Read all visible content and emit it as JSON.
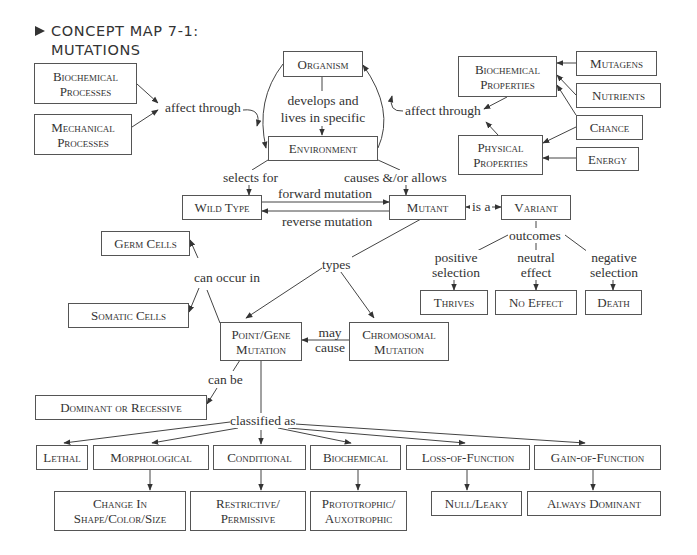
{
  "title": {
    "line1": "CONCEPT MAP 7-1:",
    "line2": "MUTATIONS",
    "marker_icon": "triangle-right-icon"
  },
  "nodes": {
    "biochemical_processes": "Biochemical Processes",
    "mechanical_processes": "Mechanical Processes",
    "organism": "Organism",
    "environment": "Environment",
    "biochemical_properties": "Biochemical Properties",
    "physical_properties": "Physical Properties",
    "mutagens": "Mutagens",
    "nutrients": "Nutrients",
    "chance": "Chance",
    "energy": "Energy",
    "wild_type": "Wild Type",
    "mutant": "Mutant",
    "variant": "Variant",
    "germ_cells": "Germ Cells",
    "somatic_cells": "Somatic Cells",
    "point_gene_mutation": "Point/Gene Mutation",
    "chromosomal_mutation": "Chromosomal Mutation",
    "thrives": "Thrives",
    "no_effect": "No Effect",
    "death": "Death",
    "dominant_or_recessive": "Dominant or Recessive",
    "lethal": "Lethal",
    "morphological": "Morphological",
    "conditional": "Conditional",
    "biochemical": "Biochemical",
    "loss_of_function": "Loss-of-Function",
    "gain_of_function": "Gain-of-Function",
    "change_in_shape": "Change In Shape/Color/Size",
    "restrictive_permissive": "Restrictive/ Permissive",
    "prototrophic_auxotrophic": "Prototrophic/ Auxotrophic",
    "null_leaky": "Null/Leaky",
    "always_dominant": "Always Dominant"
  },
  "links": {
    "affect_through_left": "affect through",
    "affect_through_right": "affect through",
    "develops_and_lives": "develops and lives in specific",
    "selects_for": "selects for",
    "causes_allows": "causes &/or allows",
    "forward_mutation": "forward mutation",
    "reverse_mutation": "reverse mutation",
    "is_a": "is a",
    "outcomes": "outcomes",
    "positive_selection": "positive selection",
    "neutral_effect": "neutral effect",
    "negative_selection": "negative selection",
    "types": "types",
    "can_occur_in": "can occur in",
    "may_cause": "may cause",
    "can_be": "can be",
    "classified_as": "classified as"
  },
  "colors": {
    "line": "#444444",
    "box_border": "#555555",
    "text": "#333333",
    "background": "#ffffff"
  }
}
